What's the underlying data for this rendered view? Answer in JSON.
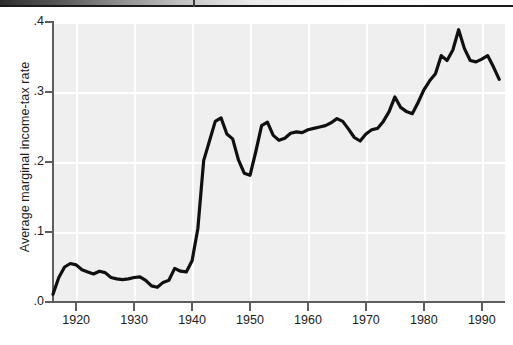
{
  "figure": {
    "kind": "scanned-book-figure",
    "line_color": "#101010",
    "plot_background": "#efefef",
    "gridline_color": "#ffffff",
    "axis_color": "#5e5e5e"
  },
  "chart_data": {
    "type": "line",
    "title": "",
    "xlabel": "",
    "ylabel": "Average marginal income-tax rate",
    "xlim": [
      1916,
      1994
    ],
    "ylim": [
      0.0,
      0.4
    ],
    "grid": true,
    "legend": null,
    "x_ticks": [
      1920,
      1930,
      1940,
      1950,
      1960,
      1970,
      1980,
      1990
    ],
    "x_tick_labels": [
      "1920",
      "1930",
      "1940",
      "1950",
      "1960",
      "1970",
      "1980",
      "1990"
    ],
    "y_ticks": [
      0.0,
      0.1,
      0.2,
      0.3,
      0.4
    ],
    "y_tick_labels": [
      ".0",
      ".1",
      ".2",
      ".3",
      ".4"
    ],
    "series": [
      {
        "name": "Average marginal income-tax rate",
        "x": [
          1916,
          1917,
          1918,
          1919,
          1920,
          1921,
          1922,
          1923,
          1924,
          1925,
          1926,
          1927,
          1928,
          1929,
          1930,
          1931,
          1932,
          1933,
          1934,
          1935,
          1936,
          1937,
          1938,
          1939,
          1940,
          1941,
          1942,
          1943,
          1944,
          1945,
          1946,
          1947,
          1948,
          1949,
          1950,
          1951,
          1952,
          1953,
          1954,
          1955,
          1956,
          1957,
          1958,
          1959,
          1960,
          1961,
          1962,
          1963,
          1964,
          1965,
          1966,
          1967,
          1968,
          1969,
          1970,
          1971,
          1972,
          1973,
          1974,
          1975,
          1976,
          1977,
          1978,
          1979,
          1980,
          1981,
          1982,
          1983,
          1984,
          1985,
          1986,
          1987,
          1988,
          1989,
          1990,
          1991,
          1992,
          1993
        ],
        "values": [
          0.011,
          0.035,
          0.05,
          0.055,
          0.053,
          0.046,
          0.043,
          0.04,
          0.044,
          0.042,
          0.035,
          0.033,
          0.032,
          0.033,
          0.035,
          0.036,
          0.031,
          0.023,
          0.021,
          0.028,
          0.031,
          0.048,
          0.044,
          0.043,
          0.059,
          0.105,
          0.202,
          0.23,
          0.258,
          0.263,
          0.24,
          0.233,
          0.203,
          0.184,
          0.181,
          0.215,
          0.252,
          0.257,
          0.238,
          0.231,
          0.234,
          0.241,
          0.243,
          0.242,
          0.246,
          0.248,
          0.25,
          0.252,
          0.256,
          0.262,
          0.258,
          0.247,
          0.235,
          0.23,
          0.24,
          0.246,
          0.248,
          0.258,
          0.272,
          0.293,
          0.278,
          0.272,
          0.269,
          0.285,
          0.303,
          0.316,
          0.326,
          0.352,
          0.345,
          0.36,
          0.389,
          0.362,
          0.345,
          0.343,
          0.347,
          0.352,
          0.336,
          0.318
        ]
      }
    ]
  }
}
